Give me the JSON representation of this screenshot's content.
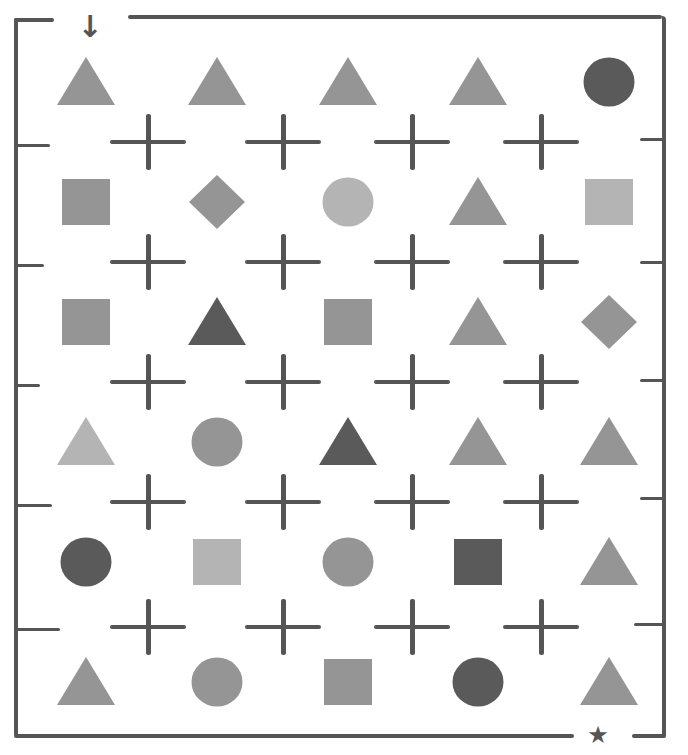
{
  "puzzle": {
    "start_marker": {
      "glyph": "↓",
      "icon": "down-arrow-icon",
      "column": 0
    },
    "end_marker": {
      "glyph": "★",
      "icon": "star-icon",
      "column": 4
    },
    "colors": {
      "light": "#b4b4b4",
      "mid": "#959595",
      "dark": "#5a5a5a",
      "wall": "#555555",
      "background": "#ffffff"
    },
    "grid": {
      "columns": 5,
      "rows": 6,
      "cells": [
        [
          {
            "shape": "triangle",
            "tone": "mid"
          },
          {
            "shape": "triangle",
            "tone": "mid"
          },
          {
            "shape": "triangle",
            "tone": "mid"
          },
          {
            "shape": "triangle",
            "tone": "mid"
          },
          {
            "shape": "circle",
            "tone": "dark"
          }
        ],
        [
          {
            "shape": "square",
            "tone": "mid"
          },
          {
            "shape": "diamond",
            "tone": "mid"
          },
          {
            "shape": "circle",
            "tone": "light"
          },
          {
            "shape": "triangle",
            "tone": "mid"
          },
          {
            "shape": "square",
            "tone": "light"
          }
        ],
        [
          {
            "shape": "square",
            "tone": "mid"
          },
          {
            "shape": "triangle",
            "tone": "dark"
          },
          {
            "shape": "square",
            "tone": "mid"
          },
          {
            "shape": "triangle",
            "tone": "mid"
          },
          {
            "shape": "diamond",
            "tone": "mid"
          }
        ],
        [
          {
            "shape": "triangle",
            "tone": "light"
          },
          {
            "shape": "circle",
            "tone": "mid"
          },
          {
            "shape": "triangle",
            "tone": "dark"
          },
          {
            "shape": "triangle",
            "tone": "mid"
          },
          {
            "shape": "triangle",
            "tone": "mid"
          }
        ],
        [
          {
            "shape": "circle",
            "tone": "dark"
          },
          {
            "shape": "square",
            "tone": "light"
          },
          {
            "shape": "circle",
            "tone": "mid"
          },
          {
            "shape": "square",
            "tone": "dark"
          },
          {
            "shape": "triangle",
            "tone": "mid"
          }
        ],
        [
          {
            "shape": "triangle",
            "tone": "mid"
          },
          {
            "shape": "circle",
            "tone": "mid"
          },
          {
            "shape": "square",
            "tone": "mid"
          },
          {
            "shape": "circle",
            "tone": "dark"
          },
          {
            "shape": "triangle",
            "tone": "mid"
          }
        ]
      ]
    }
  }
}
